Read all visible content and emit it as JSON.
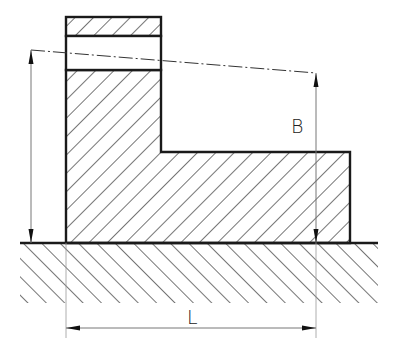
{
  "diagram": {
    "type": "technical-drawing",
    "labels": {
      "height": "B",
      "length": "L"
    },
    "colors": {
      "outline": "#1a1a1a",
      "hatch": "#2a2a2a",
      "dimension": "#777777",
      "background": "#ffffff"
    },
    "geometry": {
      "ground_y": 243,
      "ground_x": [
        20,
        378
      ],
      "top_block": {
        "x1": 66,
        "x2": 161,
        "y_top": 17,
        "y_band_top": 36,
        "y_band_bottom": 70
      },
      "body": {
        "x1": 66,
        "x2": 161,
        "step_y": 152,
        "right_x": 350
      },
      "centerline": {
        "from": [
          31,
          50
        ],
        "to": [
          316,
          73
        ]
      },
      "dim_left_x": 31,
      "dim_right_x": 316,
      "dim_L_y": 328
    }
  }
}
